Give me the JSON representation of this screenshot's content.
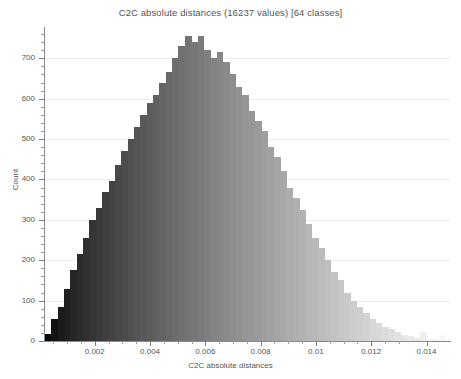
{
  "chart_data": {
    "type": "bar",
    "title": "C2C absolute distances (16237 values)  [64 classes]",
    "xlabel": "C2C absolute distances",
    "ylabel": "Count",
    "xlim": [
      0.0002,
      0.01485
    ],
    "ylim": [
      0,
      775
    ],
    "grid": true,
    "legend": "none",
    "n_values": 16237,
    "n_classes": 64,
    "bin_width": 0.00023,
    "x_ticks": [
      "0.002",
      "0.004",
      "0.006",
      "0.008",
      "0.01",
      "0.012",
      "0.014"
    ],
    "x_tick_values": [
      0.002,
      0.004,
      0.006,
      0.008,
      0.01,
      0.012,
      0.014
    ],
    "y_ticks": [
      "0",
      "100",
      "200",
      "300",
      "400",
      "500",
      "600",
      "700"
    ],
    "y_tick_values": [
      0,
      100,
      200,
      300,
      400,
      500,
      600,
      700
    ],
    "bar_colormap": "grayscale-black-to-white",
    "bar_color_start": "#000000",
    "bar_color_end": "#ffffff",
    "categories": [
      0.00031,
      0.00054,
      0.00077,
      0.001,
      0.00123,
      0.00146,
      0.00169,
      0.00192,
      0.00215,
      0.00238,
      0.00261,
      0.00284,
      0.00307,
      0.0033,
      0.00353,
      0.00376,
      0.00399,
      0.00422,
      0.00445,
      0.00468,
      0.00491,
      0.00514,
      0.00537,
      0.0056,
      0.00583,
      0.00606,
      0.00629,
      0.00652,
      0.00675,
      0.00698,
      0.00721,
      0.00744,
      0.00767,
      0.0079,
      0.00813,
      0.00836,
      0.00859,
      0.00882,
      0.00905,
      0.00928,
      0.00951,
      0.00974,
      0.00997,
      0.0102,
      0.01043,
      0.01066,
      0.01089,
      0.01112,
      0.01135,
      0.01158,
      0.01181,
      0.01204,
      0.01227,
      0.0125,
      0.01273,
      0.01296,
      0.01319,
      0.01342,
      0.01365,
      0.01388,
      0.01411,
      0.01434,
      0.01457,
      0.0148
    ],
    "values": [
      18,
      55,
      85,
      130,
      175,
      215,
      255,
      300,
      330,
      370,
      395,
      435,
      470,
      500,
      530,
      560,
      590,
      610,
      640,
      665,
      700,
      730,
      755,
      740,
      755,
      720,
      700,
      715,
      690,
      660,
      630,
      610,
      570,
      545,
      520,
      480,
      455,
      420,
      380,
      355,
      325,
      290,
      255,
      230,
      200,
      170,
      150,
      120,
      100,
      85,
      70,
      55,
      45,
      35,
      30,
      22,
      16,
      12,
      8,
      22,
      5,
      4,
      14,
      3
    ]
  }
}
